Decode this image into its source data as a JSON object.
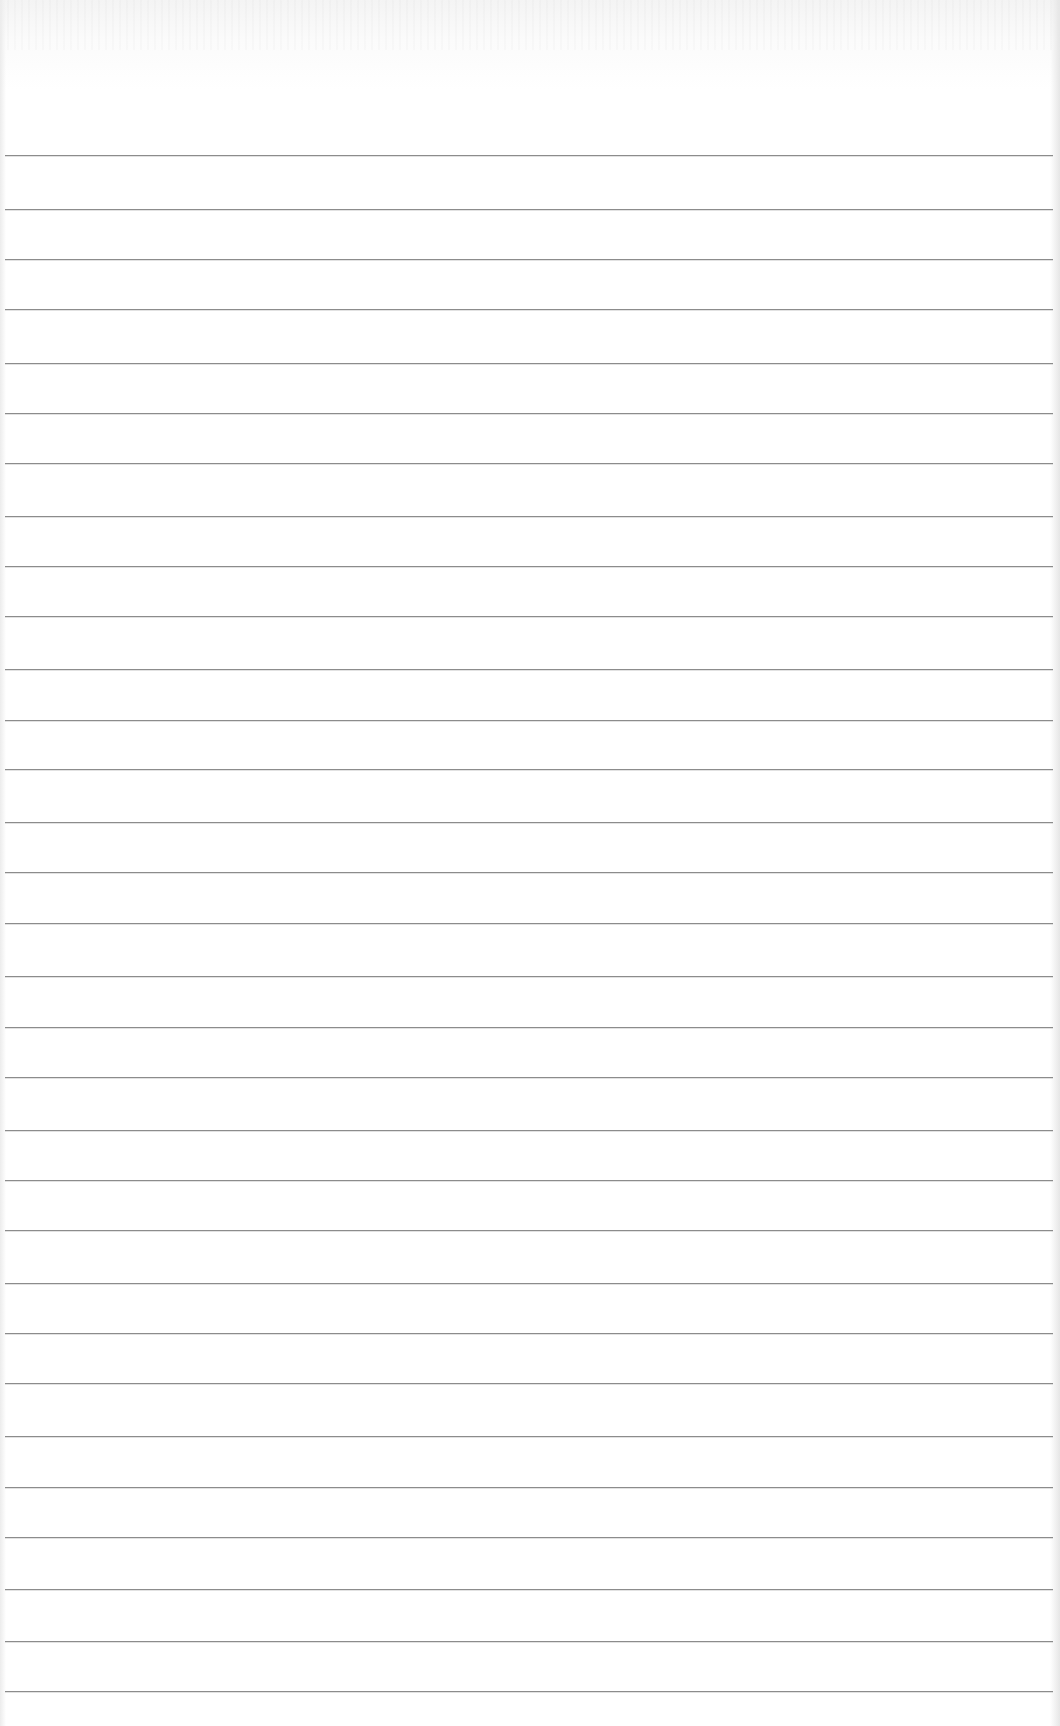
{
  "document": {
    "type": "blank ruled sheet",
    "text_content": "",
    "paper_color": "#ffffff",
    "rule_color": "#8c8c8c",
    "rule_left_x": 5,
    "rule_right_x": 1053,
    "rule_count": 31,
    "rule_positions_y": [
      155,
      209,
      259,
      309,
      363,
      413,
      463,
      516,
      566,
      616,
      669,
      720,
      769,
      822,
      872,
      923,
      976,
      1027,
      1077,
      1130,
      1180,
      1230,
      1283,
      1333,
      1383,
      1436,
      1487,
      1537,
      1589,
      1641,
      1691
    ]
  }
}
